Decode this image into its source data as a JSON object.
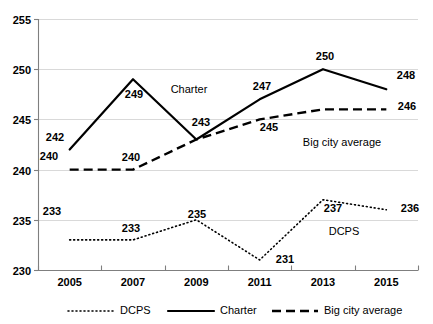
{
  "chart_data": {
    "type": "line",
    "title": "",
    "xlabel": "",
    "ylabel": "",
    "categories": [
      "2005",
      "2007",
      "2009",
      "2011",
      "2013",
      "2015"
    ],
    "ylim": [
      230,
      255
    ],
    "yticks": [
      230,
      235,
      240,
      245,
      250,
      255
    ],
    "grid": true,
    "legend_position": "bottom",
    "series": [
      {
        "name": "DCPS",
        "style": "dotted",
        "values": [
          233,
          233,
          235,
          231,
          237,
          236
        ],
        "inline_annotation": "DCPS"
      },
      {
        "name": "Charter",
        "style": "solid",
        "values": [
          242,
          249,
          243,
          247,
          250,
          248
        ],
        "inline_annotation": "Charter"
      },
      {
        "name": "Big city average",
        "style": "dashed",
        "values": [
          240,
          240,
          243,
          245,
          246,
          246
        ],
        "inline_annotation": "Big city average"
      }
    ],
    "point_labels": [
      {
        "series": "Charter",
        "category": "2005",
        "text": "240",
        "x": 49,
        "y": 160
      },
      {
        "series": "Charter",
        "category": "2005",
        "text": "242",
        "x": 55,
        "y": 141
      },
      {
        "series": "Charter",
        "category": "2007",
        "text": "249",
        "x": 134,
        "y": 98
      },
      {
        "series": "Charter",
        "category": "2009",
        "text": "243",
        "x": 201,
        "y": 126
      },
      {
        "series": "Charter",
        "category": "2011",
        "text": "247",
        "x": 262,
        "y": 90
      },
      {
        "series": "Charter",
        "category": "2013",
        "text": "250",
        "x": 325,
        "y": 60
      },
      {
        "series": "Charter",
        "category": "2015",
        "text": "248",
        "x": 406,
        "y": 79
      },
      {
        "series": "Big city average",
        "category": "2007",
        "text": "240",
        "x": 131,
        "y": 161
      },
      {
        "series": "Big city average",
        "category": "2011",
        "text": "245",
        "x": 269,
        "y": 131
      },
      {
        "series": "Big city average",
        "category": "2015",
        "text": "246",
        "x": 407,
        "y": 110
      },
      {
        "series": "DCPS",
        "category": "2005",
        "text": "233",
        "x": 52,
        "y": 215
      },
      {
        "series": "DCPS",
        "category": "2007",
        "text": "233",
        "x": 131,
        "y": 232
      },
      {
        "series": "DCPS",
        "category": "2009",
        "text": "235",
        "x": 197,
        "y": 218
      },
      {
        "series": "DCPS",
        "category": "2011",
        "text": "231",
        "x": 285,
        "y": 263
      },
      {
        "series": "DCPS",
        "category": "2013",
        "text": "237",
        "x": 333,
        "y": 212
      },
      {
        "series": "DCPS",
        "category": "2015",
        "text": "236",
        "x": 410,
        "y": 212
      }
    ],
    "series_annotations": [
      {
        "text": "Charter",
        "x": 189,
        "y": 93
      },
      {
        "text": "Big city average",
        "x": 342,
        "y": 146
      },
      {
        "text": "DCPS",
        "x": 344,
        "y": 235
      }
    ],
    "colors": {
      "line": "#000000",
      "gridline": "#d9d9d9",
      "axis": "#7f7f7f",
      "text": "#000000",
      "background": "#ffffff"
    }
  },
  "legend": {
    "items": [
      {
        "label": "DCPS",
        "style": "dotted"
      },
      {
        "label": "Charter",
        "style": "solid"
      },
      {
        "label": "Big city average",
        "style": "dashed"
      }
    ]
  }
}
